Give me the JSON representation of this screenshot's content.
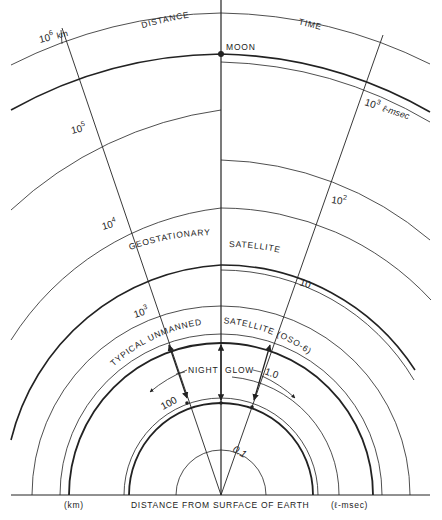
{
  "diagram": {
    "title_left": "DISTANCE",
    "title_right": "TIME",
    "ink_color": "#222222",
    "background": "#ffffff",
    "center": {
      "x": 221,
      "y": 495
    },
    "distance_scale": {
      "unit": "km",
      "ticks": [
        {
          "label": "100"
        },
        {
          "label": "10",
          "exp": "3"
        },
        {
          "label": "10",
          "exp": "4"
        },
        {
          "label": "10",
          "exp": "5"
        },
        {
          "label": "10",
          "exp": "6",
          "unit": "km"
        }
      ]
    },
    "time_scale": {
      "unit": "ℓ-msec",
      "ticks": [
        {
          "label": "0.1"
        },
        {
          "label": "1.0"
        },
        {
          "label": "10"
        },
        {
          "label": "10",
          "exp": "2"
        },
        {
          "label": "10",
          "exp": "3",
          "unit": "ℓ-msec"
        }
      ]
    },
    "features": {
      "moon": "MOON",
      "geostationary_left": "GEOSTATIONARY",
      "geostationary_right": "SATELLITE",
      "unmanned_left": "TYPICAL UNMANNED",
      "unmanned_right": "SATELLITE (OSO-6)",
      "night_glow_left": "NIGHT",
      "night_glow_right": "GLOW"
    },
    "baseline": {
      "left_unit": "(km)",
      "caption": "DISTANCE FROM SURFACE OF EARTH",
      "right_unit": "(ℓ-msec)"
    }
  }
}
